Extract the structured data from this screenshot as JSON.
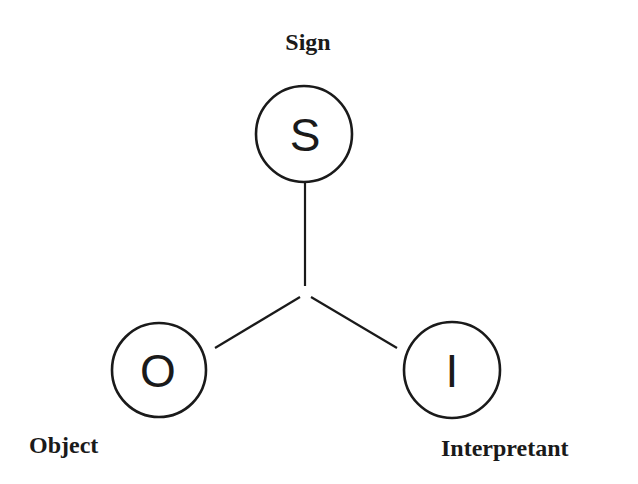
{
  "diagram": {
    "type": "triadic-sign-model",
    "nodes": [
      {
        "id": "sign",
        "letter": "S",
        "label": "Sign"
      },
      {
        "id": "object",
        "letter": "O",
        "label": "Object"
      },
      {
        "id": "interpretant",
        "letter": "I",
        "label": "Interpretant"
      }
    ],
    "edges": [
      {
        "from": "sign",
        "to": "center"
      },
      {
        "from": "center",
        "to": "object"
      },
      {
        "from": "center",
        "to": "interpretant"
      }
    ],
    "colors": {
      "stroke": "#1a1a1a",
      "background": "#ffffff"
    }
  }
}
